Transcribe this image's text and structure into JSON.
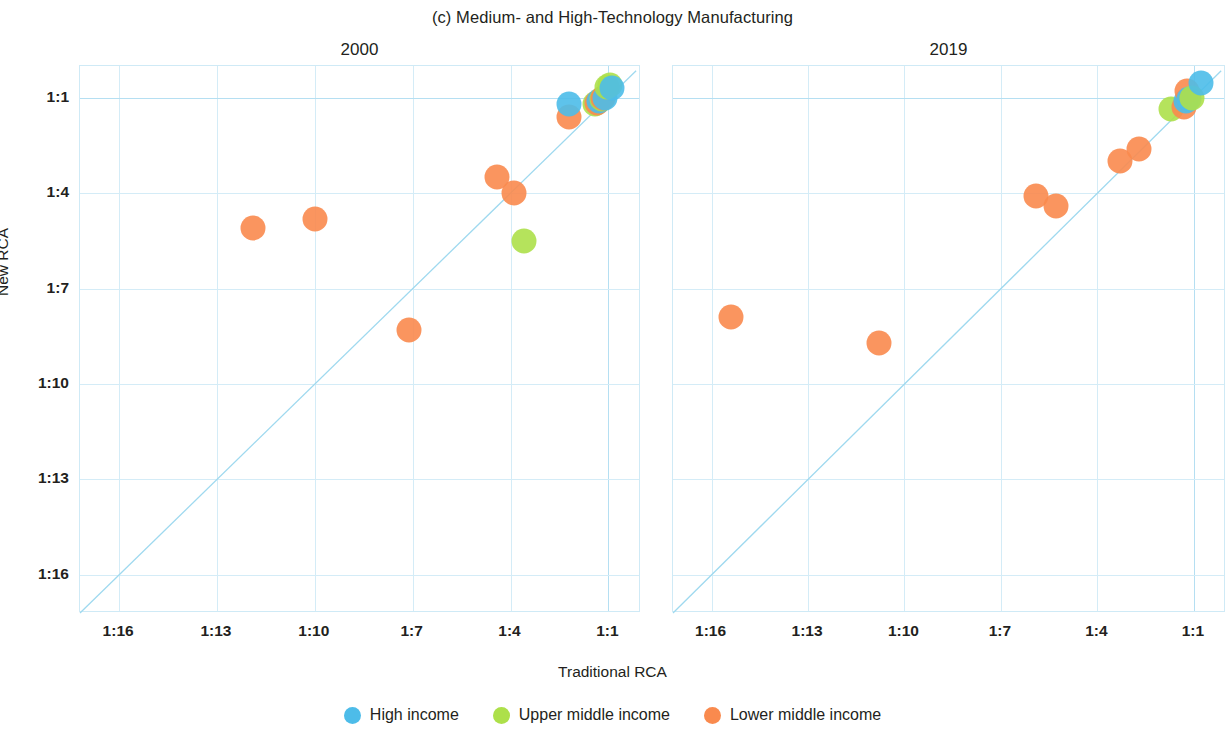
{
  "chart_data": {
    "type": "scatter",
    "title": "(c) Medium- and High-Technology Manufacturing",
    "xlabel": "Traditional RCA",
    "ylabel": "New RCA",
    "grid": true,
    "legend_position": "bottom",
    "xticks": [
      "1:16",
      "1:13",
      "1:10",
      "1:7",
      "1:4",
      "1:1"
    ],
    "yticks": [
      "1:1",
      "1:4",
      "1:7",
      "1:10",
      "1:13",
      "1:16"
    ],
    "xtick_values": [
      16,
      13,
      10,
      7,
      4,
      1
    ],
    "ytick_values": [
      1,
      4,
      7,
      10,
      13,
      16
    ],
    "xlim": [
      17.2,
      0.0
    ],
    "ylim": [
      0.0,
      17.2
    ],
    "reference_line": "1:1 diagonal (y = x)",
    "series": [
      {
        "name": "High income",
        "color": "#4DBCE9"
      },
      {
        "name": "Upper middle income",
        "color": "#ADE04A"
      },
      {
        "name": "Lower middle income",
        "color": "#F98A4E"
      }
    ],
    "panels": [
      {
        "label": "2000",
        "points": [
          {
            "group": "Lower middle income",
            "x": 11.9,
            "y": 5.1
          },
          {
            "group": "Lower middle income",
            "x": 10.0,
            "y": 4.8
          },
          {
            "group": "Lower middle income",
            "x": 7.1,
            "y": 8.3
          },
          {
            "group": "Lower middle income",
            "x": 4.4,
            "y": 3.5
          },
          {
            "group": "Lower middle income",
            "x": 3.9,
            "y": 4.0
          },
          {
            "group": "Upper middle income",
            "x": 3.6,
            "y": 5.5
          },
          {
            "group": "Lower middle income",
            "x": 2.2,
            "y": 1.6
          },
          {
            "group": "High income",
            "x": 2.2,
            "y": 1.2
          },
          {
            "group": "Upper middle income",
            "x": 1.4,
            "y": 1.2
          },
          {
            "group": "Lower middle income",
            "x": 1.35,
            "y": 1.15
          },
          {
            "group": "High income",
            "x": 1.3,
            "y": 1.1
          },
          {
            "group": "Upper middle income",
            "x": 1.2,
            "y": 1.05
          },
          {
            "group": "Lower middle income",
            "x": 1.15,
            "y": 1.0
          },
          {
            "group": "High income",
            "x": 1.1,
            "y": 1.0
          },
          {
            "group": "Upper middle income",
            "x": 1.05,
            "y": 0.65
          },
          {
            "group": "Upper middle income",
            "x": 0.95,
            "y": 0.6
          },
          {
            "group": "High income",
            "x": 0.9,
            "y": 0.7
          }
        ]
      },
      {
        "label": "2019",
        "points": [
          {
            "group": "Lower middle income",
            "x": 15.4,
            "y": 7.9
          },
          {
            "group": "Lower middle income",
            "x": 10.8,
            "y": 8.7
          },
          {
            "group": "Lower middle income",
            "x": 5.9,
            "y": 4.1
          },
          {
            "group": "Lower middle income",
            "x": 5.3,
            "y": 4.4
          },
          {
            "group": "Lower middle income",
            "x": 3.3,
            "y": 3.0
          },
          {
            "group": "Lower middle income",
            "x": 2.7,
            "y": 2.6
          },
          {
            "group": "Upper middle income",
            "x": 1.7,
            "y": 1.35
          },
          {
            "group": "Lower middle income",
            "x": 1.3,
            "y": 1.3
          },
          {
            "group": "High income",
            "x": 1.25,
            "y": 1.1
          },
          {
            "group": "Lower middle income",
            "x": 1.2,
            "y": 0.78
          },
          {
            "group": "High income",
            "x": 1.15,
            "y": 1.05
          },
          {
            "group": "Upper middle income",
            "x": 1.05,
            "y": 1.0
          },
          {
            "group": "High income",
            "x": 0.78,
            "y": 0.52
          }
        ]
      }
    ]
  },
  "figure": {
    "title": "(c) Medium- and High-Technology Manufacturing",
    "x_axis_title": "Traditional RCA",
    "y_axis_title": "New RCA"
  },
  "panels": [
    {
      "title": "2000"
    },
    {
      "title": "2019"
    }
  ],
  "axes": {
    "y_ticks": [
      "1:1",
      "1:4",
      "1:7",
      "1:10",
      "1:13",
      "1:16"
    ],
    "x_ticks": [
      "1:16",
      "1:13",
      "1:10",
      "1:7",
      "1:4",
      "1:1"
    ]
  },
  "legend": {
    "items": [
      {
        "label": "High income",
        "color": "#4DBCE9"
      },
      {
        "label": "Upper middle income",
        "color": "#ADE04A"
      },
      {
        "label": "Lower middle income",
        "color": "#F98A4E"
      }
    ]
  }
}
